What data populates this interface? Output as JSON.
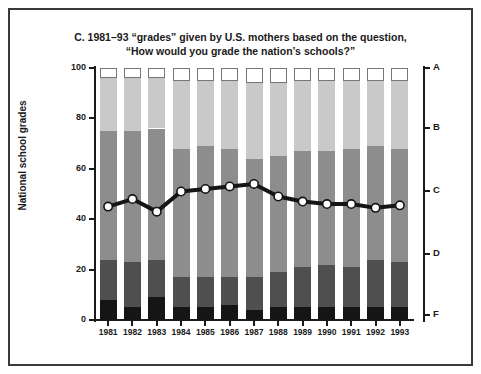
{
  "chart_data": {
    "type": "bar",
    "title": "C. 1981–93 “grades” given by U.S. mothers based on the question, “How would you grade the nation’s schools?”",
    "title_line1": "C. 1981–93 “grades” given by U.S. mothers based on the question,",
    "title_line2": "“How would you grade the nation’s schools?”",
    "subtitle": "",
    "xlabel": "",
    "ylabel": "National school grades",
    "ylim": [
      0,
      100
    ],
    "yticks": [
      0,
      20,
      40,
      60,
      80,
      100
    ],
    "ytick_labels": [
      "0",
      "20",
      "40",
      "60",
      "80",
      "100"
    ],
    "right_axis_label": "",
    "right_ticks": [
      {
        "label": "A",
        "value": 100
      },
      {
        "label": "B",
        "value": 76
      },
      {
        "label": "C",
        "value": 51
      },
      {
        "label": "D",
        "value": 26
      },
      {
        "label": "F",
        "value": 2
      }
    ],
    "categories": [
      "1981",
      "1982",
      "1983",
      "1984",
      "1985",
      "1986",
      "1987",
      "1988",
      "1989",
      "1990",
      "1991",
      "1992",
      "1993"
    ],
    "stacked": true,
    "grid": false,
    "legend": "none",
    "series": [
      {
        "name": "F",
        "color": "#151515",
        "order": 1,
        "values": [
          8,
          5,
          9,
          5,
          5,
          6,
          4,
          5,
          5,
          5,
          5,
          5,
          5
        ]
      },
      {
        "name": "D",
        "color": "#4f4f4f",
        "order": 2,
        "values": [
          16,
          18,
          15,
          12,
          12,
          11,
          13,
          14,
          16,
          17,
          16,
          19,
          18
        ]
      },
      {
        "name": "C",
        "color": "#8d8d8d",
        "order": 3,
        "values": [
          51,
          52,
          52,
          51,
          52,
          51,
          47,
          46,
          46,
          45,
          47,
          45,
          45
        ]
      },
      {
        "name": "B",
        "color": "#c9c9c9",
        "order": 4,
        "values": [
          21,
          21,
          20,
          27,
          26,
          27,
          30,
          29,
          28,
          28,
          27,
          26,
          27
        ]
      },
      {
        "name": "A",
        "color": "#ffffff",
        "order": 5,
        "values": [
          4,
          4,
          4,
          5,
          5,
          5,
          6,
          6,
          5,
          5,
          5,
          5,
          5
        ]
      }
    ],
    "overlay_line": {
      "name": "Average grade",
      "marker": "circle",
      "marker_fill": "#ffffff",
      "marker_edge": "#151515",
      "line_color": "#151515",
      "values": [
        45,
        48,
        43,
        51,
        52,
        53,
        54,
        49,
        47,
        46,
        46,
        44.5,
        45.5
      ]
    }
  },
  "colors": {
    "frame": "#3a3a3a",
    "axis": "#1a1a1a",
    "background": "#ffffff",
    "grade_a": "#ffffff",
    "grade_b": "#c9c9c9",
    "grade_c": "#8d8d8d",
    "grade_d": "#4f4f4f",
    "grade_f": "#151515"
  }
}
